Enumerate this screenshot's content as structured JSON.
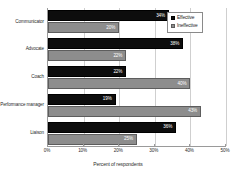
{
  "chart_data": {
    "type": "bar",
    "orientation": "horizontal",
    "title": "",
    "xlabel": "Percent of respondents",
    "ylabel": "",
    "xlim": [
      0,
      50
    ],
    "xticks": [
      "0%",
      "10%",
      "20%",
      "30%",
      "40%",
      "50%"
    ],
    "xtick_values": [
      0,
      10,
      20,
      30,
      40,
      50
    ],
    "grid": true,
    "grid_axis": "x",
    "legend_position": "top-right",
    "categories": [
      "Communicator",
      "Advocate",
      "Coach",
      "Performance manager",
      "Liaison"
    ],
    "series": [
      {
        "name": "Effective",
        "color": "#0d0d0d",
        "values": [
          34,
          38,
          22,
          19,
          36
        ],
        "labels": [
          "34%",
          "38%",
          "22%",
          "19%",
          "36%"
        ]
      },
      {
        "name": "Ineffective",
        "color": "#8d8d8d",
        "values": [
          20,
          22,
          40,
          43,
          25
        ],
        "labels": [
          "20%",
          "22%",
          "40%",
          "43%",
          "25%"
        ]
      }
    ]
  },
  "legend": {
    "entries": [
      {
        "label": "Effective"
      },
      {
        "label": "Ineffective"
      }
    ]
  }
}
